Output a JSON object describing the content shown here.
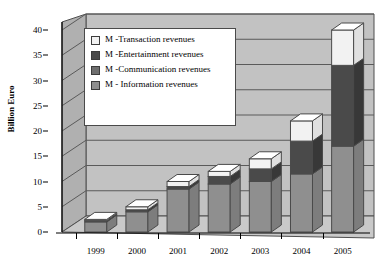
{
  "chart_data": {
    "type": "bar",
    "subtype": "stacked-column-3d",
    "title": "",
    "xlabel": "",
    "ylabel": "Billion Euro",
    "ylim": [
      0,
      40
    ],
    "yticks": [
      0,
      5,
      10,
      15,
      20,
      25,
      30,
      35,
      40
    ],
    "ytick_labels": [
      "0",
      "5",
      "10",
      "15",
      "20",
      "25",
      "30",
      "35",
      "40"
    ],
    "grid": true,
    "legend_position": "upper-left-inside",
    "categories": [
      "1999",
      "2000",
      "2001",
      "2002",
      "2003",
      "2004",
      "2005"
    ],
    "series": [
      {
        "name": "M - Information revenues",
        "color": "#8f8f8f",
        "values": [
          2.0,
          4.0,
          8.5,
          9.5,
          10.0,
          11.5,
          17.0
        ]
      },
      {
        "name": "M -Communication revenues",
        "color": "#6e6e6e",
        "values": [
          0.0,
          0.0,
          0.0,
          0.0,
          0.0,
          0.0,
          0.0
        ]
      },
      {
        "name": "M -Entertainment revenues",
        "color": "#4a4a4a",
        "values": [
          0.3,
          0.4,
          0.5,
          1.5,
          2.5,
          6.5,
          16.0
        ]
      },
      {
        "name": "M -Transaction revenues",
        "color": "#f2f2f2",
        "values": [
          0.2,
          0.6,
          1.0,
          1.0,
          2.0,
          4.0,
          7.0
        ]
      }
    ],
    "totals": [
      2.5,
      5.0,
      10.0,
      12.0,
      14.5,
      22.0,
      40.0
    ]
  },
  "legend": {
    "entries": [
      {
        "label": "M -Transaction revenues",
        "color": "#f2f2f2"
      },
      {
        "label": "M -Entertainment revenues",
        "color": "#4a4a4a"
      },
      {
        "label": "M -Communication revenues",
        "color": "#6e6e6e"
      },
      {
        "label": "M - Information revenues",
        "color": "#8f8f8f"
      }
    ]
  },
  "axis": {
    "y_title": "Billion Euro"
  },
  "colors": {
    "plot_background": "#c2c2c2",
    "left_wall": "#b5b5b5",
    "floor": "#c8c8c8",
    "gridline": "#5a5a5a",
    "bar_outline": "#4a4a4a",
    "page_background": "#ffffff"
  }
}
